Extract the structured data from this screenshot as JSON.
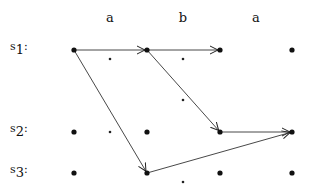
{
  "diagram": {
    "column_labels": [
      {
        "text": "a",
        "x": 110
      },
      {
        "text": "b",
        "x": 183
      },
      {
        "text": "a",
        "x": 256
      }
    ],
    "row_labels": [
      {
        "prefix": "s",
        "sub": "1",
        "colon": ":",
        "y": 42
      },
      {
        "prefix": "s",
        "sub": "2",
        "colon": ":",
        "y": 124
      },
      {
        "prefix": "s",
        "sub": "3",
        "colon": ":",
        "y": 165
      }
    ],
    "nodes": [
      {
        "id": "s1-0",
        "x": 74,
        "y": 50
      },
      {
        "id": "s1-1",
        "x": 147,
        "y": 50
      },
      {
        "id": "s1-2",
        "x": 220,
        "y": 50
      },
      {
        "id": "s1-3",
        "x": 292,
        "y": 50
      },
      {
        "id": "s2-0",
        "x": 74,
        "y": 132
      },
      {
        "id": "s2-1",
        "x": 147,
        "y": 132
      },
      {
        "id": "s2-2",
        "x": 220,
        "y": 132
      },
      {
        "id": "s2-3",
        "x": 292,
        "y": 132
      },
      {
        "id": "s3-0",
        "x": 74,
        "y": 173
      },
      {
        "id": "s3-1",
        "x": 147,
        "y": 173
      },
      {
        "id": "s3-2",
        "x": 220,
        "y": 173
      },
      {
        "id": "s3-3",
        "x": 292,
        "y": 173
      }
    ],
    "small_dots": [
      {
        "x": 110,
        "y": 59
      },
      {
        "x": 183,
        "y": 59
      },
      {
        "x": 183,
        "y": 100
      },
      {
        "x": 110,
        "y": 132
      },
      {
        "x": 183,
        "y": 182
      }
    ],
    "edges": [
      {
        "from": "s1-0",
        "to": "s1-1"
      },
      {
        "from": "s1-1",
        "to": "s1-2"
      },
      {
        "from": "s1-0",
        "to": "s3-1"
      },
      {
        "from": "s1-1",
        "to": "s2-2"
      },
      {
        "from": "s2-2",
        "to": "s2-3"
      },
      {
        "from": "s3-1",
        "to": "s2-3"
      }
    ]
  }
}
